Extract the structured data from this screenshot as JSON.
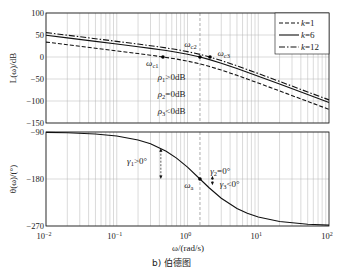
{
  "figure": {
    "xlabel": "ω/(rad/s)",
    "caption": "b) 伯德图"
  },
  "chart_data": [
    {
      "type": "line",
      "panel": "magnitude",
      "title": "",
      "xlabel": "ω/(rad/s)",
      "ylabel": "L(ω)/dB",
      "xscale": "log",
      "xlim": [
        0.01,
        100
      ],
      "ylim": [
        -150,
        100
      ],
      "xticks": [
        0.01,
        0.1,
        1,
        10,
        100
      ],
      "xtick_labels": [
        {
          "base": "10",
          "exp": "−2"
        },
        {
          "base": "10",
          "exp": "−1"
        },
        {
          "base": "10",
          "exp": "0"
        },
        {
          "base": "10",
          "exp": "1"
        },
        {
          "base": "10",
          "exp": "2"
        }
      ],
      "yticks": [
        100,
        50,
        0,
        -50,
        -100,
        -150
      ],
      "ytick_labels": [
        "100",
        "50",
        "0",
        "−50",
        "−100",
        "−150"
      ],
      "grid": true,
      "legend_position": "upper right",
      "x": [
        0.01,
        0.02,
        0.05,
        0.1,
        0.2,
        0.3,
        0.5,
        0.7,
        1,
        1.5,
        2,
        3,
        5,
        7,
        10,
        20,
        50,
        100
      ],
      "series": [
        {
          "name": "k=1",
          "style": "dashed",
          "values": [
            33.9,
            27.9,
            20.0,
            13.9,
            7.8,
            4.1,
            -1.0,
            -4.7,
            -9.3,
            -15.6,
            -21.0,
            -29.6,
            -41.7,
            -50.1,
            -59.2,
            -77.1,
            -101.0,
            -119.0
          ]
        },
        {
          "name": "k=6",
          "style": "solid",
          "values": [
            49.5,
            43.5,
            35.6,
            29.5,
            23.4,
            19.7,
            14.6,
            10.9,
            6.3,
            0.0,
            -5.4,
            -14.0,
            -26.1,
            -34.5,
            -43.6,
            -61.5,
            -85.4,
            -103.4
          ]
        },
        {
          "name": "k=12",
          "style": "dashdot",
          "values": [
            55.5,
            49.5,
            41.6,
            35.5,
            29.4,
            25.7,
            20.6,
            16.9,
            12.3,
            6.0,
            0.6,
            -8.0,
            -20.1,
            -28.5,
            -37.6,
            -55.5,
            -79.4,
            -97.4
          ]
        }
      ],
      "reference_line": {
        "x": 1.5,
        "style": "dashed"
      },
      "markers": [
        {
          "name": "omega-c1",
          "x": 0.45,
          "y": 0
        },
        {
          "name": "omega-c2",
          "x": 1.5,
          "y": 0
        },
        {
          "name": "omega-c3",
          "x": 2.08,
          "y": 0
        }
      ],
      "annotations": [
        {
          "name": "omega-c1-label",
          "main": "ω",
          "sub": "c1",
          "rest": "",
          "x": 0.26,
          "y": -20
        },
        {
          "name": "omega-c2-label",
          "main": "ω",
          "sub": "c2",
          "rest": "",
          "x": 0.9,
          "y": 23
        },
        {
          "name": "omega-c3-label",
          "main": "ω",
          "sub": "c3",
          "rest": "",
          "x": 2.65,
          "y": 2
        },
        {
          "name": "rho1-label",
          "main": "ρ",
          "sub": "1",
          "rest": ">0dB",
          "x": 0.38,
          "y": -52
        },
        {
          "name": "rho2-label",
          "main": "ρ",
          "sub": "2",
          "rest": "=0dB",
          "x": 0.38,
          "y": -91
        },
        {
          "name": "rho3-label",
          "main": "ρ",
          "sub": "3",
          "rest": "<0dB",
          "x": 0.38,
          "y": -130
        }
      ]
    },
    {
      "type": "line",
      "panel": "phase",
      "title": "",
      "xlabel": "ω/(rad/s)",
      "ylabel": "θ(ω)/(°)",
      "xscale": "log",
      "xlim": [
        0.01,
        100
      ],
      "ylim": [
        -270,
        -90
      ],
      "yticks": [
        -90,
        -180,
        -270
      ],
      "ytick_labels": [
        "−90",
        "−180",
        "−270"
      ],
      "grid": true,
      "x": [
        0.01,
        0.02,
        0.05,
        0.1,
        0.2,
        0.3,
        0.5,
        0.7,
        1,
        1.5,
        2,
        3,
        5,
        7,
        10,
        20,
        50,
        100
      ],
      "series": [
        {
          "name": "phase",
          "style": "solid",
          "values": [
            -90.8,
            -91.5,
            -93.8,
            -97.6,
            -105.2,
            -112.6,
            -126.9,
            -140.0,
            -157.4,
            -180.0,
            -196.3,
            -216.9,
            -236.6,
            -245.8,
            -252.9,
            -261.4,
            -266.6,
            -268.3
          ]
        }
      ],
      "reference_line": {
        "x": 1.5,
        "style": "dashed"
      },
      "markers": [
        {
          "name": "omega-a",
          "x": 1.5,
          "y": -180
        }
      ],
      "arrows": [
        {
          "name": "gamma1-arrow",
          "x": 0.42,
          "y1": -121,
          "y2": -180
        },
        {
          "name": "gamma3-arrow",
          "x": 2.25,
          "y1": -174,
          "y2": -192
        }
      ],
      "annotations": [
        {
          "name": "gamma1-label",
          "main": "γ",
          "sub": "1",
          "rest": ">0°",
          "x": 0.14,
          "y": -151
        },
        {
          "name": "omega-a-label",
          "main": "ω",
          "sub": "a",
          "rest": "",
          "x": 0.9,
          "y": -197
        },
        {
          "name": "gamma2-label",
          "main": "γ",
          "sub": "2",
          "rest": "=0°",
          "x": 2.1,
          "y": -170
        },
        {
          "name": "gamma3-label",
          "main": "γ",
          "sub": "3",
          "rest": "<0°",
          "x": 2.85,
          "y": -195
        }
      ]
    }
  ]
}
